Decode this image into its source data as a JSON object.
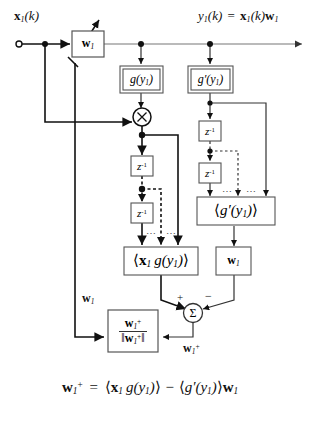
{
  "figure": {
    "caption_equation": "w₁⁺ = ⟨x₁ g(y₁)⟩ − ⟨g′(y₁)⟩w₁"
  },
  "labels": {
    "input_signal": "x₁(k)",
    "output_signal": "y₁(k) = x₁(k)w₁",
    "feedback_weight": "w₁",
    "sum_output": "w₁⁺",
    "plus_sign": "+",
    "minus_sign": "−",
    "ellipsis_left": "⋯",
    "ellipsis_right": "⋯"
  },
  "blocks": {
    "weight_top": "w₁",
    "weight_bottom": "w₁",
    "nonlinearity": "g(y₁)",
    "nonlinearity_derivative": "g′(y₁)",
    "delay": "z⁻¹",
    "expectation_xg": "⟨x₁ g(y₁)⟩",
    "expectation_gprime": "⟨g′(y₁)⟩",
    "normalize_num": "w₁⁺",
    "normalize_den": "‖w₁⁺‖",
    "multiplier": "×",
    "summer": "Σ"
  },
  "equation": {
    "lhs": "w₁⁺",
    "eq": "=",
    "term1": "⟨x₁ g(y₁)⟩",
    "op": "−",
    "term2": "⟨g′(y₁)⟩w₁"
  },
  "colors": {
    "stroke": "#111111",
    "box_border": "#555555",
    "thin_line": "#777777",
    "background": "#ffffff"
  }
}
